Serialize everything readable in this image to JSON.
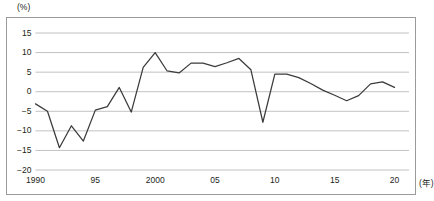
{
  "figure": {
    "y_unit_label": "(%)",
    "x_unit_label": "(年)"
  },
  "axis": {
    "y_ticks": [
      "15",
      "10",
      "5",
      "0",
      "−5",
      "−10",
      "−15",
      "−20"
    ],
    "x_ticks": [
      "1990",
      "95",
      "2000",
      "05",
      "10",
      "15",
      "20"
    ]
  },
  "style": {
    "line_color": "#3b3b3b",
    "grid_color": "#a6a6a6",
    "frame_color": "#9b9b9b",
    "text_color": "#231f20",
    "background": "#ffffff"
  },
  "chart_data": {
    "type": "line",
    "title": "",
    "subtitle": "",
    "xlabel": "(年)",
    "ylabel": "(%)",
    "xlim": [
      1990,
      2020
    ],
    "ylim": [
      -20,
      15
    ],
    "grid": true,
    "grid_axis": "y",
    "legend": false,
    "legend_position": "none",
    "y_tick_values": [
      15,
      10,
      5,
      0,
      -5,
      -10,
      -15,
      -20
    ],
    "x_tick_values": [
      1990,
      1995,
      2000,
      2005,
      2010,
      2015,
      2020
    ],
    "x_tick_labels": [
      "1990",
      "95",
      "2000",
      "05",
      "10",
      "15",
      "20"
    ],
    "x": [
      1990,
      1991,
      1992,
      1993,
      1994,
      1995,
      1996,
      1997,
      1998,
      1999,
      2000,
      2001,
      2002,
      2003,
      2004,
      2005,
      2006,
      2007,
      2008,
      2009,
      2010,
      2011,
      2012,
      2013,
      2014,
      2015,
      2016,
      2017,
      2018,
      2019,
      2020
    ],
    "series": [
      {
        "name": "",
        "values": [
          -3.1,
          -5.0,
          -14.3,
          -8.7,
          -12.6,
          -4.7,
          -3.8,
          1.1,
          -5.2,
          6.2,
          10.0,
          5.3,
          4.8,
          7.3,
          7.3,
          6.4,
          7.4,
          8.5,
          5.6,
          -7.8,
          4.5,
          4.5,
          3.6,
          2.1,
          0.4,
          -0.9,
          -2.3,
          -1.0,
          2.0,
          2.5,
          1.1
        ]
      }
    ],
    "annotations": []
  }
}
